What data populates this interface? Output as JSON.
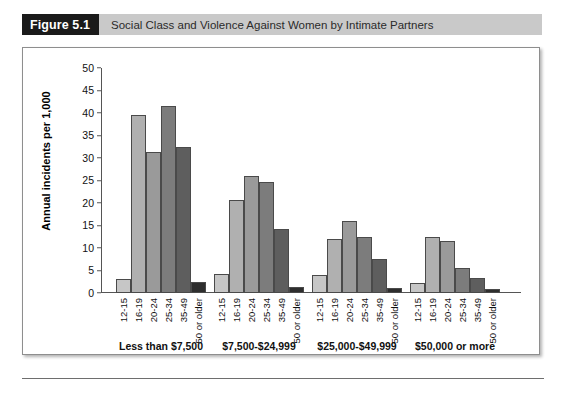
{
  "figure": {
    "number": "Figure 5.1",
    "title": "Social Class and Violence Against Women by Intimate Partners"
  },
  "chart_data": {
    "type": "bar",
    "title": "Social Class and Violence Against Women by Intimate Partners",
    "xlabel": "",
    "ylabel": "Annual incidents per 1,000",
    "ylim": [
      0,
      50
    ],
    "ytick_step": 5,
    "yticks": [
      0,
      5,
      10,
      15,
      20,
      25,
      30,
      35,
      40,
      45,
      50
    ],
    "grid": false,
    "legend": "none",
    "categories": [
      "12-15",
      "16-19",
      "20-24",
      "25-34",
      "35-49",
      "50 or older"
    ],
    "groups": [
      {
        "label": "Less than $7,500",
        "values": [
          3.1,
          39.5,
          31.4,
          41.6,
          32.5,
          2.5
        ]
      },
      {
        "label": "$7,500-$24,999",
        "values": [
          4.3,
          20.6,
          26.0,
          24.6,
          14.2,
          1.3
        ]
      },
      {
        "label": "$25,000-$49,999",
        "values": [
          4.1,
          12.1,
          16.0,
          12.5,
          7.5,
          1.2
        ]
      },
      {
        "label": "$50,000 or more",
        "values": [
          2.2,
          12.4,
          11.5,
          5.6,
          3.3,
          1.0
        ]
      }
    ],
    "series_colors": [
      "#c6c6c6",
      "#b0b0b0",
      "#9a9a9a",
      "#7c7c7c",
      "#5e5e5e",
      "#2e2e2e"
    ]
  }
}
